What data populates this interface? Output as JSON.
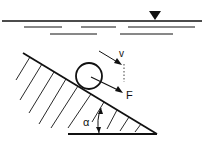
{
  "diagram": {
    "labels": {
      "velocity": "v",
      "force": "F",
      "angle": "α"
    },
    "symbols": {
      "water_surface": "inverted-triangle-marker"
    },
    "colors": {
      "ink": "#111111",
      "background": "#ffffff"
    }
  }
}
